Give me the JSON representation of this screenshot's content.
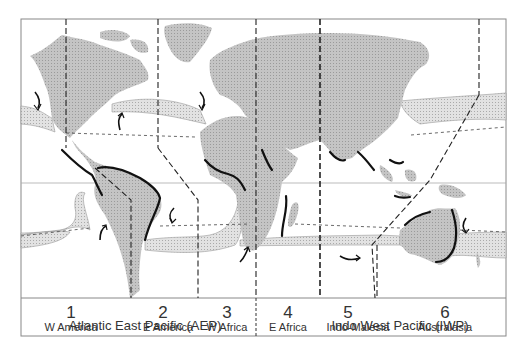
{
  "figure": {
    "type": "biogeographic map",
    "colors": {
      "land": "#bdbdbd",
      "band": "#d6d6d6",
      "coast": "#111111",
      "frame": "#777777",
      "text": "#333333"
    }
  },
  "regions": [
    {
      "number": "1",
      "name": "W America"
    },
    {
      "number": "2",
      "name": "E America"
    },
    {
      "number": "3",
      "name": "W Africa"
    },
    {
      "number": "4",
      "name": "E Africa"
    },
    {
      "number": "5",
      "name": "Indo-Malesia"
    },
    {
      "number": "6",
      "name": "Australasia"
    }
  ],
  "provinces": [
    {
      "name": "Atlantic East Pacific (AEP)"
    },
    {
      "name": "Indo West Pacific (IWP)"
    }
  ]
}
